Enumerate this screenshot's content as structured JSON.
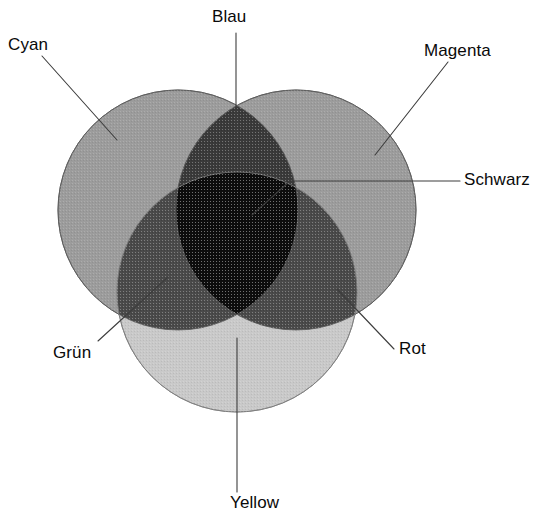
{
  "figure": {
    "background_color": "#ffffff",
    "width": 543,
    "height": 527
  },
  "labels": {
    "cyan": "Cyan",
    "blau": "Blau",
    "magenta": "Magenta",
    "schwarz": "Schwarz",
    "rot": "Rot",
    "gruen": "Grün",
    "yellow": "Yellow"
  },
  "chart_data": {
    "type": "venn",
    "title": "",
    "xlabel": "",
    "ylabel": "",
    "grid": false,
    "legend": "none",
    "sets": [
      {
        "name": "Cyan",
        "label": "Cyan",
        "cx": 178,
        "cy": 210,
        "r": 120,
        "fill": "#9c9c9c",
        "stroke": "#6b6b6b"
      },
      {
        "name": "Magenta",
        "label": "Magenta",
        "cx": 296,
        "cy": 210,
        "r": 120,
        "fill": "#9c9c9c",
        "stroke": "#6b6b6b"
      },
      {
        "name": "Yellow",
        "label": "Yellow",
        "cx": 237,
        "cy": 292,
        "r": 120,
        "fill": "#c9c9c9",
        "stroke": "#8f8f8f"
      }
    ],
    "intersections": [
      {
        "name": "Blau",
        "label": "Blau",
        "members": [
          "Cyan",
          "Magenta"
        ],
        "fill": "#3a3a3a"
      },
      {
        "name": "Gruen",
        "label": "Grün",
        "members": [
          "Cyan",
          "Yellow"
        ],
        "fill": "#4a4a4a"
      },
      {
        "name": "Rot",
        "label": "Rot",
        "members": [
          "Magenta",
          "Yellow"
        ],
        "fill": "#4a4a4a"
      },
      {
        "name": "Schwarz",
        "label": "Schwarz",
        "members": [
          "Cyan",
          "Magenta",
          "Yellow"
        ],
        "fill": "#0d0d0d"
      }
    ],
    "leader_lines": [
      {
        "name": "Cyan",
        "points": "42,56 117,140"
      },
      {
        "name": "Blau",
        "points": "236,33 236,150"
      },
      {
        "name": "Magenta",
        "points": "448,62 375,155"
      },
      {
        "name": "Schwarz",
        "points": "460,181 290,181 252,215"
      },
      {
        "name": "Rot",
        "points": "394,349 337,289"
      },
      {
        "name": "Gruen",
        "points": "98,341 168,277"
      },
      {
        "name": "Yellow",
        "points": "237,492 237,338"
      }
    ],
    "leader_color": "#3d3d3d",
    "text_color": "#0a0a0a"
  }
}
